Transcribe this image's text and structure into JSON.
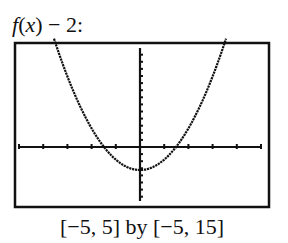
{
  "title": {
    "func": "f",
    "open_paren": "(",
    "var": "x",
    "rest": ") − 2:"
  },
  "caption": "[−5, 5] by [−5, 15]",
  "chart_data": {
    "type": "line",
    "title": "f(x) − 2:",
    "function": "f(x) - 2 where f(x) = x^2",
    "xlabel": "",
    "ylabel": "",
    "xlim": [
      -5,
      5
    ],
    "ylim": [
      -5,
      15
    ],
    "xscale_tick": 1,
    "yscale_tick": 1,
    "grid": false,
    "legend": null,
    "window_caption": "[−5, 5] by [−5, 15]",
    "series": [
      {
        "name": "f(x) - 2",
        "x": [
          -3.5,
          -3,
          -2.5,
          -2,
          -1.5,
          -1.41,
          -1,
          -0.5,
          0,
          0.5,
          1,
          1.41,
          1.5,
          2,
          2.5,
          3,
          3.5
        ],
        "y": [
          10.25,
          7,
          4.25,
          2,
          0.25,
          0,
          -1,
          -1.75,
          -2,
          -1.75,
          -1,
          0,
          0.25,
          2,
          4.25,
          7,
          10.25
        ]
      }
    ],
    "key_points": {
      "vertex": [
        0,
        -2
      ],
      "x_intercepts": [
        -1.41,
        1.41
      ]
    }
  },
  "colors": {
    "ink": "#111111",
    "background": "#ffffff"
  }
}
